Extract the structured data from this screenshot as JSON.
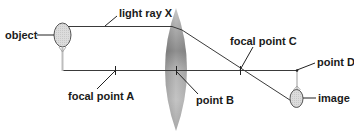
{
  "diagram": {
    "labels": {
      "object": "object",
      "light_ray": "light ray X",
      "focal_point_a": "focal point A",
      "point_b": "point B",
      "focal_point_c": "focal point C",
      "point_d": "point D",
      "image": "image"
    },
    "colors": {
      "line": "#333333",
      "lens_dark": "#8a8a8a",
      "lens_light": "#d8d8d8",
      "racket_fill": "#d9d9d9",
      "background": "#ffffff"
    }
  }
}
